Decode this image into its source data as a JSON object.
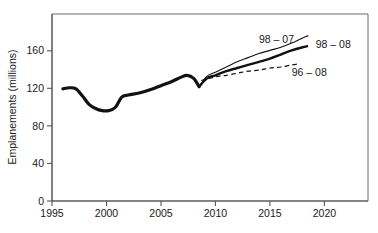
{
  "chart_data": {
    "type": "line",
    "title": "",
    "xlabel": "",
    "ylabel": "Emplanements (millions)",
    "xlim": [
      1995,
      2024
    ],
    "ylim": [
      0,
      180
    ],
    "grid": false,
    "legend": "inline-labels",
    "xticks": [
      "1995",
      "2000",
      "2005",
      "2010",
      "2015",
      "2020"
    ],
    "xtick_values": [
      1995,
      2000,
      2005,
      2010,
      2015,
      2020
    ],
    "yticks": [
      "0",
      "40",
      "80",
      "120",
      "160"
    ],
    "ytick_values": [
      0,
      40,
      80,
      120,
      160
    ],
    "series": [
      {
        "name": "historique",
        "label": "",
        "style": "solid-heavy",
        "x": [
          1996.0,
          1996.6,
          1997.2,
          1997.8,
          1998.4,
          1999.0,
          1999.6,
          2000.2,
          2000.8,
          2001.4,
          2002.0,
          2003.0,
          2004.0,
          2005.0,
          2006.0,
          2006.8,
          2007.4,
          2008.0,
          2008.5
        ],
        "values": [
          108,
          109,
          108,
          101,
          93,
          89,
          87,
          87,
          90,
          100,
          102,
          104,
          107,
          111,
          115,
          119,
          121,
          118,
          110
        ]
      },
      {
        "name": "98 - 07",
        "label": "98 – 07",
        "style": "solid-thin",
        "x": [
          2008.5,
          2009.2,
          2010.0,
          2011.0,
          2012.0,
          2013.0,
          2014.0,
          2015.0,
          2016.0,
          2017.0,
          2018.0,
          2018.5
        ],
        "values": [
          110,
          120,
          124,
          129,
          134,
          138,
          142,
          145,
          148,
          152,
          157,
          159
        ]
      },
      {
        "name": "98 - 08",
        "label": "98 – 08",
        "style": "solid-medium",
        "x": [
          2008.5,
          2009.2,
          2010.0,
          2011.0,
          2012.0,
          2013.0,
          2014.0,
          2015.0,
          2016.0,
          2017.0,
          2018.0,
          2018.4
        ],
        "values": [
          110,
          118,
          121,
          125,
          128,
          131,
          134,
          137,
          141,
          145,
          148,
          149
        ]
      },
      {
        "name": "96 - 08",
        "label": "96 – 08",
        "style": "dashed",
        "x": [
          2008.7,
          2009.4,
          2010.2,
          2011.0,
          2012.0,
          2013.0,
          2014.0,
          2015.0,
          2016.0,
          2017.0,
          2017.6
        ],
        "values": [
          116,
          118,
          120,
          121,
          123,
          125,
          126,
          128,
          129,
          131,
          132
        ]
      }
    ],
    "annotations": [
      {
        "name": "label-98-07",
        "text": "98 – 07",
        "x": 2014.0,
        "y": 152
      },
      {
        "name": "label-98-08",
        "text": "98 – 08",
        "x": 2019.2,
        "y": 147
      },
      {
        "name": "label-96-08",
        "text": "96 – 08",
        "x": 2017.0,
        "y": 120
      }
    ]
  }
}
